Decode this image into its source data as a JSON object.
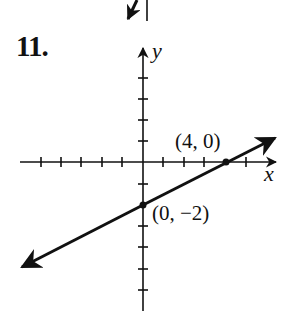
{
  "problem": {
    "number": "11."
  },
  "graph": {
    "x_axis_label": "x",
    "y_axis_label": "y",
    "points": [
      {
        "label": "(4, 0)",
        "x": 4,
        "y": 0
      },
      {
        "label": "(0, −2)",
        "x": 0,
        "y": -2
      }
    ],
    "line": {
      "slope": 0.5,
      "intercept": -2,
      "equation": "y = x/2 - 2"
    },
    "x_ticks_range": [
      -6,
      5
    ],
    "y_ticks_range": [
      -5,
      4
    ],
    "colors": {
      "ink": "#111111",
      "background": "#ffffff"
    }
  }
}
